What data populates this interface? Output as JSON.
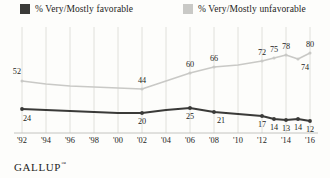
{
  "legend": {
    "favorable": {
      "label": "% Very/Mostly favorable",
      "swatch_name": "legend-swatch-favorable",
      "color": "#3a3a38"
    },
    "unfavorable": {
      "label": "% Very/Mostly unfavorable",
      "swatch_name": "legend-swatch-unfavorable",
      "color": "#c9c9c6"
    }
  },
  "footer": {
    "brand": "GALLUP",
    "trademark": "™"
  },
  "chart_data": {
    "type": "line",
    "title": "",
    "subtitle": "",
    "xlabel": "",
    "ylabel": "",
    "ylim": [
      0,
      100
    ],
    "grid": "vertical",
    "legend_position": "top",
    "categories": [
      "'92",
      "'94",
      "'96",
      "'98",
      "'00",
      "'02",
      "'04",
      "'06",
      "'08",
      "'10",
      "'12",
      "'14",
      "'16"
    ],
    "x": [
      1992,
      1994,
      1996,
      1998,
      2000,
      2002,
      2004,
      2006,
      2008,
      2010,
      2012,
      2014,
      2016
    ],
    "series": [
      {
        "name": "% Very/Mostly unfavorable",
        "color": "#c9c9c6",
        "points": [
          {
            "x": "'92",
            "y": 52,
            "label": "52",
            "label_pos": "above-left"
          },
          {
            "x": "'94",
            "y": 49,
            "label": "",
            "label_pos": ""
          },
          {
            "x": "'96",
            "y": 47,
            "label": "",
            "label_pos": ""
          },
          {
            "x": "'98",
            "y": 46,
            "label": "",
            "label_pos": ""
          },
          {
            "x": "'00",
            "y": 45,
            "label": "",
            "label_pos": ""
          },
          {
            "x": "'02",
            "y": 44,
            "label": "44",
            "label_pos": "above"
          },
          {
            "x": "'04",
            "y": 52,
            "label": "",
            "label_pos": ""
          },
          {
            "x": "'06",
            "y": 60,
            "label": "60",
            "label_pos": "above"
          },
          {
            "x": "'08",
            "y": 66,
            "label": "66",
            "label_pos": "above"
          },
          {
            "x": "'10",
            "y": 68,
            "label": "",
            "label_pos": ""
          },
          {
            "x": "'12",
            "y": 72,
            "label": "72",
            "label_pos": "above"
          },
          {
            "x": "'13",
            "y": 75,
            "label": "75",
            "label_pos": "above"
          },
          {
            "x": "'14",
            "y": 78,
            "label": "78",
            "label_pos": "above"
          },
          {
            "x": "'15",
            "y": 74,
            "label": "74",
            "label_pos": "below-right"
          },
          {
            "x": "'16",
            "y": 80,
            "label": "80",
            "label_pos": "above"
          }
        ]
      },
      {
        "name": "% Very/Mostly favorable",
        "color": "#3a3a38",
        "points": [
          {
            "x": "'92",
            "y": 24,
            "label": "24",
            "label_pos": "below-left"
          },
          {
            "x": "'94",
            "y": 23,
            "label": "",
            "label_pos": ""
          },
          {
            "x": "'96",
            "y": 22,
            "label": "",
            "label_pos": ""
          },
          {
            "x": "'98",
            "y": 21,
            "label": "",
            "label_pos": ""
          },
          {
            "x": "'00",
            "y": 20,
            "label": "",
            "label_pos": ""
          },
          {
            "x": "'02",
            "y": 20,
            "label": "20",
            "label_pos": "below"
          },
          {
            "x": "'04",
            "y": 23,
            "label": "",
            "label_pos": ""
          },
          {
            "x": "'06",
            "y": 25,
            "label": "25",
            "label_pos": "below"
          },
          {
            "x": "'08",
            "y": 21,
            "label": "21",
            "label_pos": "below-right"
          },
          {
            "x": "'10",
            "y": 19,
            "label": "",
            "label_pos": ""
          },
          {
            "x": "'12",
            "y": 17,
            "label": "17",
            "label_pos": "below"
          },
          {
            "x": "'13",
            "y": 14,
            "label": "14",
            "label_pos": "below"
          },
          {
            "x": "'14",
            "y": 13,
            "label": "13",
            "label_pos": "below"
          },
          {
            "x": "'15",
            "y": 14,
            "label": "14",
            "label_pos": "below"
          },
          {
            "x": "'16",
            "y": 12,
            "label": "12",
            "label_pos": "below"
          }
        ]
      }
    ]
  }
}
